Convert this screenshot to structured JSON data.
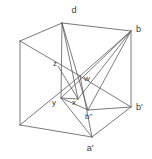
{
  "figure": {
    "background_color": "#ffffff",
    "stroke_color": "#555555",
    "label_color": "#3b3b3b",
    "width": 152,
    "height": 159
  },
  "labels": {
    "d": "d",
    "b": "b",
    "z": "z",
    "w": "w",
    "y": "y",
    "x": "x",
    "b2": "b\"",
    "b1": "b'",
    "a1": "a'"
  },
  "label_positions": {
    "d": {
      "x": 74,
      "y": 13
    },
    "b": {
      "x": 136,
      "y": 32
    },
    "z": {
      "x": 55,
      "y": 66
    },
    "w": {
      "x": 83,
      "y": 81
    },
    "y": {
      "x": 54,
      "y": 104
    },
    "x": {
      "x": 74,
      "y": 104
    },
    "b2": {
      "x": 86,
      "y": 119
    },
    "b1": {
      "x": 136,
      "y": 110
    },
    "a1": {
      "x": 90,
      "y": 150
    }
  },
  "vertices": {
    "d": {
      "x": 62,
      "y": 23
    },
    "b": {
      "x": 131,
      "y": 31
    },
    "left_top": {
      "x": 20,
      "y": 41
    },
    "left_bottom": {
      "x": 20,
      "y": 125
    },
    "b_prime": {
      "x": 131,
      "y": 107
    },
    "a_prime": {
      "x": 92,
      "y": 137
    },
    "w": {
      "x": 80,
      "y": 76
    },
    "z": {
      "x": 62,
      "y": 70
    },
    "y": {
      "x": 61,
      "y": 98
    },
    "x": {
      "x": 78,
      "y": 99
    },
    "b_dprime": {
      "x": 88,
      "y": 110
    }
  },
  "edges": [
    {
      "name": "d-to-left-top",
      "from": "d",
      "to": "left_top"
    },
    {
      "name": "d-to-b",
      "from": "d",
      "to": "b"
    },
    {
      "name": "left-top-to-left-bottom",
      "from": "left_top",
      "to": "left_bottom"
    },
    {
      "name": "b-to-b-prime",
      "from": "b",
      "to": "b_prime"
    },
    {
      "name": "left-bottom-to-a-prime",
      "from": "left_bottom",
      "to": "a_prime"
    },
    {
      "name": "a-prime-to-b-prime",
      "from": "a_prime",
      "to": "b_prime"
    },
    {
      "name": "left-top-to-w",
      "from": "left_top",
      "to": "w"
    },
    {
      "name": "left-bottom-to-w",
      "from": "left_bottom",
      "to": "w"
    },
    {
      "name": "b-dprime-to-b-prime",
      "from": "b_dprime",
      "to": "b_prime"
    }
  ],
  "inner_lines": [
    {
      "name": "d-to-y",
      "from": "d",
      "to": "y"
    },
    {
      "name": "d-to-x",
      "from": "d",
      "to": "x"
    },
    {
      "name": "d-to-b-dprime",
      "from": "d",
      "to": "b_dprime"
    },
    {
      "name": "b-to-w",
      "from": "b",
      "to": "w"
    },
    {
      "name": "b-to-y",
      "from": "b",
      "to": "y"
    },
    {
      "name": "b-to-x",
      "from": "b",
      "to": "x"
    },
    {
      "name": "b-to-b-dprime",
      "from": "b",
      "to": "b_dprime"
    },
    {
      "name": "z-to-x",
      "from": "z",
      "to": "x"
    },
    {
      "name": "y-to-x",
      "from": "y",
      "to": "x"
    },
    {
      "name": "y-to-b-dprime",
      "from": "y",
      "to": "b_dprime"
    },
    {
      "name": "w-to-a-prime",
      "from": "w",
      "to": "a_prime"
    },
    {
      "name": "w-to-b-prime",
      "from": "w",
      "to": "b_prime"
    },
    {
      "name": "y-to-a-prime",
      "from": "y",
      "to": "a_prime"
    }
  ]
}
